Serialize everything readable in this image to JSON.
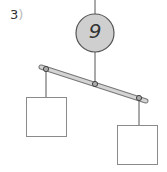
{
  "problem": {
    "number": "3",
    "close_paren": ")"
  },
  "mobile": {
    "top_weight": {
      "value": "9",
      "shape": "circle",
      "fill": "#cfcfcf"
    },
    "left_box": {
      "value": "",
      "shape": "square"
    },
    "right_box": {
      "value": "",
      "shape": "square"
    },
    "bar_color": "#c8c8c8"
  }
}
